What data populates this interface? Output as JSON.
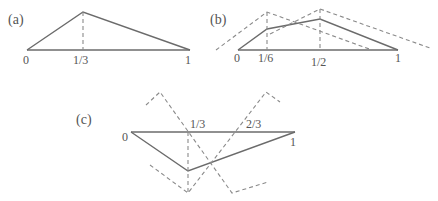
{
  "panels": {
    "a": {
      "label": "(a)",
      "ticks": [
        "0",
        "1/3",
        "1"
      ],
      "description": "Single hat function on [0,1] with peak at 1/3"
    },
    "b": {
      "label": "(b)",
      "ticks": [
        "0",
        "1/6",
        "1/2",
        "1"
      ],
      "description": "Piecewise linear function with kinks at 1/6 and 1/2, shown with dashed hat functions"
    },
    "c": {
      "label": "(c)",
      "ticks": [
        "0",
        "1/3",
        "2/3",
        "1"
      ],
      "description": "Piecewise linear function with negative dip, dashed hat functions centered at 1/3 and 2/3"
    }
  },
  "colors": {
    "solid_line": "#6b6b6b",
    "dashed_line": "#8a8a8a",
    "text": "#555555",
    "background": "#ffffff"
  }
}
